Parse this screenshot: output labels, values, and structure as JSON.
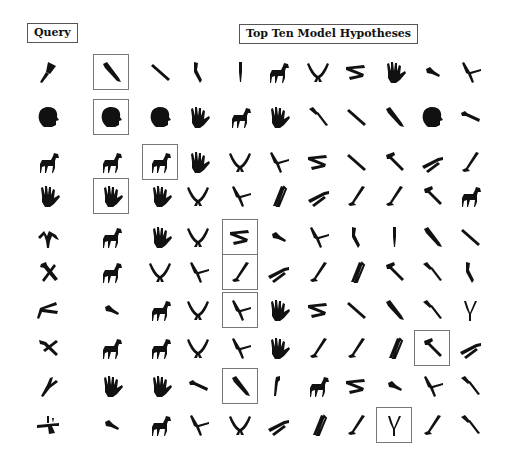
{
  "header": {
    "query_label": "Query",
    "hypotheses_label": "Top Ten Model Hypotheses"
  },
  "grid": {
    "columns": [
      "query",
      "h1",
      "h2",
      "h3",
      "h4",
      "h5",
      "h6",
      "h7",
      "h8",
      "h9",
      "h10"
    ],
    "rows": [
      {
        "query": "cleaver",
        "hypotheses": [
          "knife",
          "screwdriver-thin",
          "knife-blade",
          "screwdriver-small",
          "horse",
          "pliers-open",
          "pliers-folded",
          "hand",
          "screwdriver-tiny",
          "pliers-cross"
        ],
        "match_index": 0
      },
      {
        "query": "head",
        "hypotheses": [
          "head",
          "head",
          "hand",
          "horse",
          "hand",
          "screwdriver",
          "screwdriver-thin",
          "knife",
          "head",
          "wrench"
        ],
        "match_index": 0
      },
      {
        "query": "horse",
        "hypotheses": [
          "horse",
          "horse",
          "hand",
          "pliers-open",
          "pliers-cross",
          "pliers-folded",
          "screwdriver-thin",
          "hammer",
          "pliers-side",
          "hammer-l"
        ],
        "match_index": 1
      },
      {
        "query": "hand",
        "hypotheses": [
          "hand",
          "hand",
          "pliers-open",
          "pliers-cross",
          "tongs",
          "pliers-side",
          "hammer-l",
          "hammer-l",
          "hammer",
          "horse"
        ],
        "match_index": 0
      },
      {
        "query": "pliers-up",
        "hypotheses": [
          "horse",
          "hand",
          "pliers-open",
          "pliers-folded",
          "screwdriver-tiny",
          "pliers-cross",
          "knife-blade",
          "screwdriver-small",
          "knife",
          "screwdriver-thin"
        ],
        "match_index": 3
      },
      {
        "query": "hammer-cross",
        "hypotheses": [
          "horse",
          "pliers-open",
          "pliers-cross",
          "hammer-l",
          "pliers-side",
          "hammer-l",
          "tongs",
          "hammer",
          "screwdriver",
          "knife-blade"
        ],
        "match_index": 3
      },
      {
        "query": "scissors",
        "hypotheses": [
          "screwdriver-tiny",
          "horse",
          "pliers-open",
          "pliers-cross",
          "hand",
          "pliers-folded",
          "screwdriver-thin",
          "knife",
          "screwdriver",
          "tweezers"
        ],
        "match_index": 3
      },
      {
        "query": "hammer-pliers",
        "hypotheses": [
          "horse",
          "horse",
          "pliers-open",
          "pliers-cross",
          "hand",
          "hammer-l",
          "hammer-l",
          "tongs",
          "hammer",
          "pliers-side"
        ],
        "match_index": 8
      },
      {
        "query": "branch",
        "hypotheses": [
          "hand",
          "hand",
          "wrench",
          "knife",
          "wrench-small",
          "horse",
          "pliers-folded",
          "screwdriver-tiny",
          "pliers-cross",
          "screwdriver"
        ],
        "match_index": 3
      },
      {
        "query": "tool-cross",
        "hypotheses": [
          "screwdriver-tiny",
          "horse",
          "pliers-cross",
          "pliers-open",
          "pliers-side",
          "tongs",
          "hammer-l",
          "tweezers",
          "hammer-l",
          "screwdriver"
        ],
        "match_index": 7
      }
    ]
  },
  "colors": {
    "ink": "#111111",
    "box": "#777777",
    "background": "#ffffff"
  }
}
